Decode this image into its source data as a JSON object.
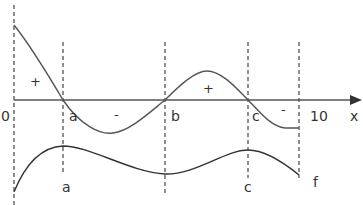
{
  "diagram": {
    "axis": {
      "label": "x",
      "start_label": "0",
      "end_label": "10"
    },
    "critical_points": [
      "a",
      "b",
      "c"
    ],
    "top_curve": {
      "name": "f'",
      "signs": [
        "+",
        "-",
        "+",
        "-"
      ]
    },
    "bottom_curve": {
      "name": "f",
      "point_labels": [
        "a",
        "c"
      ],
      "curve_label": "f"
    },
    "colors": {
      "curve": "#555555",
      "axis": "#555555",
      "dashed": "#444444",
      "text": "#333333"
    }
  }
}
